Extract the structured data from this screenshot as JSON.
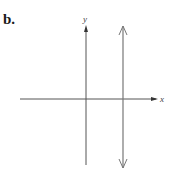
{
  "figure": {
    "part_label": "b.",
    "x_axis_label": "x",
    "y_axis_label": "y",
    "colors": {
      "axis": "#555555",
      "line": "#777777",
      "label": "#1a1a1a"
    }
  }
}
